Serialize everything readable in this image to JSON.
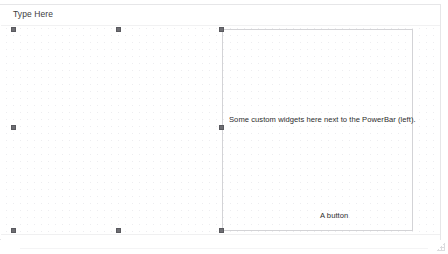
{
  "window": {
    "title": "",
    "background_color": "#ffffff",
    "border_color": "#e6e6e8"
  },
  "menubar": {
    "type_here_label": "Type Here",
    "hint": "menu-editor-placeholder"
  },
  "canvas": {
    "grid_visible": true,
    "grid_spacing_px": 7,
    "grid_dot_color": "#ededf0"
  },
  "selected_widget": {
    "name": "custom-widget-frame",
    "border_color": "#d3d3d6",
    "description_text": "Some custom widgets here next to the PowerBar (left).",
    "button_label": "A button"
  },
  "handles": {
    "color": "#6e6e73",
    "items": [
      {
        "name": "handle-left-top",
        "x": 11,
        "y": 27
      },
      {
        "name": "handle-left-middle-top",
        "x": 116,
        "y": 27
      },
      {
        "name": "handle-left-middle-left",
        "x": 11,
        "y": 125
      },
      {
        "name": "handle-left-bottom",
        "x": 11,
        "y": 228
      },
      {
        "name": "handle-left-bottom-middle",
        "x": 116,
        "y": 228
      },
      {
        "name": "handle-widget-top-left",
        "x": 219,
        "y": 27
      },
      {
        "name": "handle-widget-middle-left",
        "x": 219,
        "y": 125
      },
      {
        "name": "handle-widget-bottom-left",
        "x": 219,
        "y": 228
      }
    ]
  },
  "statusbar": {
    "text": ""
  },
  "resize_grip": {
    "name": "resize-grip",
    "color": "#dcdcdf"
  }
}
